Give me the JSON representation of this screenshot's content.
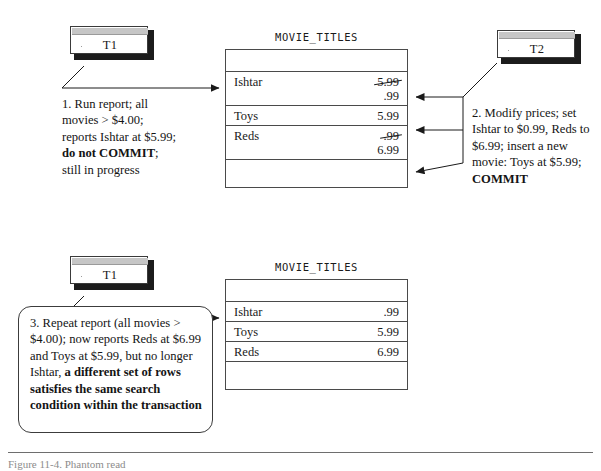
{
  "figure": {
    "caption": "Figure 11-4. Phantom read"
  },
  "top_scene": {
    "note": {
      "label": "T1"
    },
    "step": {
      "segments": [
        {
          "text": "1. Run report; all movies > $4.00; reports Ishtar at $5.99; ",
          "bold": false
        },
        {
          "text": "do not COMMIT",
          "bold": true
        },
        {
          "text": "; still in progress",
          "bold": false
        }
      ]
    },
    "table": {
      "title": "MOVIE_TITLES",
      "rows": [
        {
          "name": "",
          "price": "",
          "price_old": "",
          "blank": true
        },
        {
          "name": "Ishtar",
          "price_old": "5.99",
          "price": ".99",
          "struck": true
        },
        {
          "name": "Toys",
          "price": "5.99",
          "price_old": "",
          "struck": false
        },
        {
          "name": "Reds",
          "price_old": ".99",
          "price": "6.99",
          "struck": true
        },
        {
          "name": "",
          "price": "",
          "price_old": "",
          "blank": true
        }
      ]
    },
    "note2": {
      "label": "T2"
    },
    "step2": {
      "segments": [
        {
          "text": "2. Modify prices; set Ishtar to $0.99, Reds to $6.99; insert a new movie: Toys at $5.99; ",
          "bold": false
        },
        {
          "text": "COMMIT",
          "bold": true
        }
      ]
    }
  },
  "bottom_scene": {
    "note": {
      "label": "T1"
    },
    "step": {
      "segments": [
        {
          "text": "3. Repeat report (all movies > $4.00); now reports Reds at $6.99 and Toys at $5.99, but no longer Ishtar, ",
          "bold": false
        },
        {
          "text": "a different set of rows satisfies the same search condition within the transaction",
          "bold": true
        }
      ]
    },
    "table": {
      "title": "MOVIE_TITLES",
      "rows": [
        {
          "name": "",
          "price": "",
          "blank": true
        },
        {
          "name": "Ishtar",
          "price": ".99"
        },
        {
          "name": "Toys",
          "price": "5.99"
        },
        {
          "name": "Reds",
          "price": "6.99"
        },
        {
          "name": "",
          "price": "",
          "blank": true
        }
      ]
    }
  },
  "colors": {
    "ink": "#1a1a1a",
    "rule": "#4a4a4a",
    "titlebar": "#c6c6c6",
    "shadow": "#1c1c1c",
    "caption": "#8c8c8c"
  }
}
